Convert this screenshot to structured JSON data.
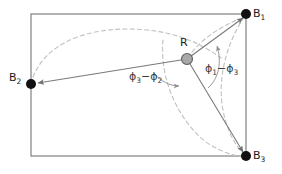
{
  "figure": {
    "type": "geometry-diagram",
    "canvas": {
      "width": 282,
      "height": 174,
      "background": "#ffffff"
    },
    "arena": {
      "name": "arena-rectangle",
      "x1": 31,
      "y1": 14,
      "x2": 246,
      "y2": 156,
      "stroke": "#808080",
      "stroke_width": 1.2
    },
    "colors": {
      "beacon_fill": "#111111",
      "robot_fill": "#a0a0a0",
      "robot_stroke": "#555555",
      "line": "#777777",
      "dashed_arc": "#bdbdbd",
      "angle_arc": "#999999",
      "text": "#1a1a1a"
    },
    "nodes": [
      {
        "id": "B1",
        "label": "B",
        "sub": "1",
        "x": 246,
        "y": 14,
        "r": 5,
        "kind": "beacon",
        "label_x": 253,
        "label_y": 9
      },
      {
        "id": "B2",
        "label": "B",
        "sub": "2",
        "x": 31,
        "y": 84,
        "r": 5,
        "kind": "beacon",
        "label_x": 9,
        "label_y": 73
      },
      {
        "id": "B3",
        "label": "B",
        "sub": "3",
        "x": 246,
        "y": 156,
        "r": 5,
        "kind": "beacon",
        "label_x": 253,
        "label_y": 151
      },
      {
        "id": "R",
        "label": "R",
        "sub": "",
        "x": 187,
        "y": 59,
        "r": 5.5,
        "kind": "robot",
        "label_x": 180,
        "label_y": 38
      }
    ],
    "rays": [
      {
        "id": "R-to-B1",
        "from": "R",
        "to": "B1"
      },
      {
        "id": "R-to-B2",
        "from": "R",
        "to": "B2"
      },
      {
        "id": "R-to-B3",
        "from": "R",
        "to": "B3"
      }
    ],
    "angles": [
      {
        "id": "phi3-minus-phi2",
        "text": "ϕ",
        "sub_a": "3",
        "op": "−",
        "text2": "ϕ",
        "sub_b": "2",
        "label_x": 129,
        "label_y": 72,
        "between": [
          "R-to-B2",
          "R-to-B3"
        ]
      },
      {
        "id": "phi1-minus-phi3",
        "text": "ϕ",
        "sub_a": "1",
        "op": "−",
        "text2": "ϕ",
        "sub_b": "3",
        "label_x": 205,
        "label_y": 64,
        "between": [
          "R-to-B3",
          "R-to-B1"
        ]
      }
    ],
    "dashed_arcs": [
      {
        "id": "circle-B2-R-B1",
        "description": "circular arc through B2, R and B1"
      },
      {
        "id": "circle-R-B3",
        "description": "circular arc through R and B3"
      },
      {
        "id": "circle-B1-B3",
        "description": "circular arc through B1 and B3"
      }
    ]
  }
}
